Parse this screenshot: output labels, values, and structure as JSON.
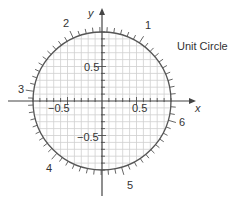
{
  "title": "Unit Circle",
  "axes": {
    "x_label": "x",
    "y_label": "y",
    "x_ticks": [
      {
        "value": -0.5,
        "label": "−0.5"
      },
      {
        "value": 0.5,
        "label": "0.5"
      }
    ],
    "y_ticks": [
      {
        "value": 0.5,
        "label": "0.5"
      },
      {
        "value": -0.5,
        "label": "−0.5"
      }
    ],
    "minor_tick_step": 0.1
  },
  "circle": {
    "radius": 1,
    "radian_tick_step": 0.1,
    "radian_labels": [
      "1",
      "2",
      "3",
      "4",
      "5",
      "6"
    ]
  },
  "grid": {
    "step": 0.1,
    "color": "#c8c8c8"
  },
  "colors": {
    "circle": "#555555",
    "axis": "#444444",
    "text": "#333333",
    "grid": "#cfcfcf"
  }
}
